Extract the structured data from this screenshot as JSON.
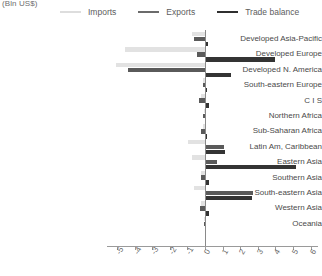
{
  "chart_data": {
    "type": "bar",
    "orientation": "horizontal",
    "title": "(Bln US$)",
    "xlabel": "",
    "ylabel": "",
    "xlim": [
      -5,
      6
    ],
    "xticks": [
      "-5",
      "-4",
      "-3",
      "-2",
      "-1",
      "0",
      "1",
      "2",
      "3",
      "4",
      "5",
      "6"
    ],
    "grid": false,
    "legend_position": "top",
    "categories": [
      "Developed Asia-Pacific",
      "Developed Europe",
      "Developed N. America",
      "South-eastern Europe",
      "C I S",
      "Northern Africa",
      "Sub-Saharan Africa",
      "Latin Am, Caribbean",
      "Eastern Asia",
      "Southern Asia",
      "South-eastern Asia",
      "Western Asia",
      "Oceania"
    ],
    "series": [
      {
        "name": "Imports",
        "color": "#e2e2e2",
        "values": [
          -0.75,
          -4.55,
          -5.05,
          -0.12,
          -0.2,
          -0.08,
          -0.12,
          -0.95,
          -0.75,
          -0.2,
          -0.6,
          -0.22,
          -0.05
        ]
      },
      {
        "name": "Exports",
        "color": "#5a5a5a",
        "values": [
          -0.6,
          -0.45,
          -4.35,
          -0.1,
          -0.35,
          -0.1,
          -0.2,
          1.1,
          0.7,
          -0.25,
          2.7,
          -0.3,
          -0.04
        ]
      },
      {
        "name": "Trade balance",
        "color": "#343434",
        "values": [
          0.18,
          4.0,
          1.45,
          0.1,
          0.22,
          0.08,
          0.12,
          1.15,
          5.15,
          0.2,
          2.65,
          0.2,
          0.05
        ]
      }
    ]
  },
  "legend": {
    "items": [
      {
        "label": "Imports",
        "color": "#dddddd"
      },
      {
        "label": "Exports",
        "color": "#6b6b6b"
      },
      {
        "label": "Trade balance",
        "color": "#2f2f2f"
      }
    ]
  },
  "axis": {
    "zero_color": "#8a8a8a",
    "line_color": "#9a9a9a"
  }
}
